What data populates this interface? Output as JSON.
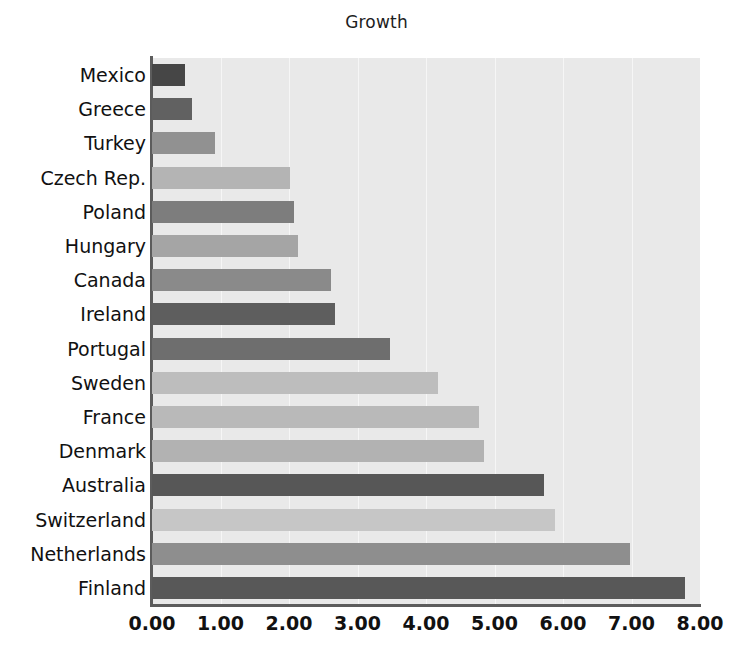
{
  "chart_data": {
    "type": "bar",
    "orientation": "horizontal",
    "title": "Growth",
    "xlabel": "",
    "ylabel": "",
    "xlim": [
      0,
      8
    ],
    "xticks": [
      0,
      1,
      2,
      3,
      4,
      5,
      6,
      7,
      8
    ],
    "xtick_labels": [
      "0.00",
      "1.00",
      "2.00",
      "3.00",
      "4.00",
      "5.00",
      "6.00",
      "7.00",
      "8.00"
    ],
    "grid": true,
    "grid_axis": "x",
    "legend": false,
    "panel_background": "#e9e9e9",
    "categories": [
      "Mexico",
      "Greece",
      "Turkey",
      "Czech Rep.",
      "Poland",
      "Hungary",
      "Canada",
      "Ireland",
      "Portugal",
      "Sweden",
      "France",
      "Denmark",
      "Australia",
      "Switzerland",
      "Netherlands",
      "Finland"
    ],
    "values": [
      0.48,
      0.58,
      0.92,
      2.01,
      2.07,
      2.13,
      2.62,
      2.67,
      3.48,
      4.18,
      4.78,
      4.85,
      5.72,
      5.88,
      6.98,
      7.78
    ],
    "bar_colors": [
      "#464646",
      "#616161",
      "#919191",
      "#b4b4b4",
      "#7d7d7d",
      "#a5a5a5",
      "#8a8a8a",
      "#5e5e5e",
      "#6e6e6e",
      "#bdbdbd",
      "#b9b9b9",
      "#b2b2b2",
      "#575757",
      "#c6c6c6",
      "#8e8e8e",
      "#585858"
    ],
    "bars": [
      {
        "label": "Mexico",
        "value": 0.48,
        "value_text": "0.48",
        "color": "#464646"
      },
      {
        "label": "Greece",
        "value": 0.58,
        "value_text": "0.58",
        "color": "#616161"
      },
      {
        "label": "Turkey",
        "value": 0.92,
        "value_text": "0.92",
        "color": "#919191"
      },
      {
        "label": "Czech Rep.",
        "value": 2.01,
        "value_text": "2.01",
        "color": "#b4b4b4"
      },
      {
        "label": "Poland",
        "value": 2.07,
        "value_text": "2.07",
        "color": "#7d7d7d"
      },
      {
        "label": "Hungary",
        "value": 2.13,
        "value_text": "2.13",
        "color": "#a5a5a5"
      },
      {
        "label": "Canada",
        "value": 2.62,
        "value_text": "2.62",
        "color": "#8a8a8a"
      },
      {
        "label": "Ireland",
        "value": 2.67,
        "value_text": "2.67",
        "color": "#5e5e5e"
      },
      {
        "label": "Portugal",
        "value": 3.48,
        "value_text": "3.48",
        "color": "#6e6e6e"
      },
      {
        "label": "Sweden",
        "value": 4.18,
        "value_text": "4.18",
        "color": "#bdbdbd"
      },
      {
        "label": "France",
        "value": 4.78,
        "value_text": "4.78",
        "color": "#b9b9b9"
      },
      {
        "label": "Denmark",
        "value": 4.85,
        "value_text": "4.85",
        "color": "#b2b2b2"
      },
      {
        "label": "Australia",
        "value": 5.72,
        "value_text": "5.72",
        "color": "#575757"
      },
      {
        "label": "Switzerland",
        "value": 5.88,
        "value_text": "5.88",
        "color": "#c6c6c6"
      },
      {
        "label": "Netherlands",
        "value": 6.98,
        "value_text": "6.98",
        "color": "#8e8e8e"
      },
      {
        "label": "Finland",
        "value": 7.78,
        "value_text": "7.78",
        "color": "#585858"
      }
    ]
  }
}
